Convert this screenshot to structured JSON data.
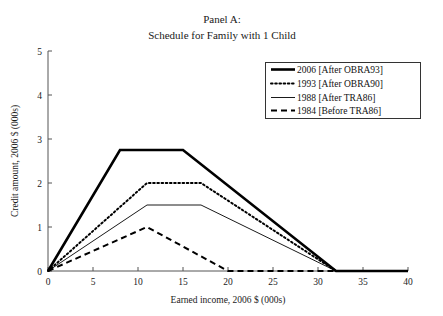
{
  "chart_data": {
    "type": "line",
    "title": "Panel A:",
    "subtitle": "Schedule for Family with 1 Child",
    "xlabel": "Earned income, 2006 $ (000s)",
    "ylabel": "Credit amount, 2006 $ (000s)",
    "xlim": [
      0,
      40
    ],
    "ylim": [
      0,
      5
    ],
    "xticks": [
      0,
      5,
      10,
      15,
      20,
      25,
      30,
      35,
      40
    ],
    "xtick_labels": [
      "0",
      "5",
      "10",
      "15",
      "20",
      "25",
      "30",
      "35",
      "40"
    ],
    "yticks": [
      0,
      1,
      2,
      3,
      4,
      5
    ],
    "ytick_labels": [
      "0",
      "1",
      "2",
      "3",
      "4",
      "5"
    ],
    "grid": false,
    "legend_position": "upper right",
    "series": [
      {
        "name": "2006 [After OBRA93]",
        "style": "thick-solid",
        "color": "#000000",
        "x": [
          0,
          8,
          15,
          32,
          40
        ],
        "y": [
          0,
          2.75,
          2.75,
          0,
          0
        ]
      },
      {
        "name": "1993 [After OBRA90]",
        "style": "dotted",
        "color": "#000000",
        "x": [
          0,
          11,
          17,
          32,
          40
        ],
        "y": [
          0,
          2.0,
          2.0,
          0,
          0
        ]
      },
      {
        "name": "1988 [After TRA86]",
        "style": "thin-solid",
        "color": "#000000",
        "x": [
          0,
          11,
          17,
          32,
          40
        ],
        "y": [
          0,
          1.5,
          1.5,
          0,
          0
        ]
      },
      {
        "name": "1984 [Before TRA86]",
        "style": "dashed",
        "color": "#000000",
        "x": [
          0,
          11,
          20,
          40
        ],
        "y": [
          0,
          1.0,
          0,
          0
        ]
      }
    ]
  },
  "legend": {
    "entries": [
      {
        "label": "2006 [After OBRA93]"
      },
      {
        "label": "1993 [After OBRA90]"
      },
      {
        "label": "1988 [After TRA86]"
      },
      {
        "label": "1984 [Before TRA86]"
      }
    ]
  }
}
